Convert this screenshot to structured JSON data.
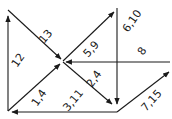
{
  "diagram": {
    "type": "directed-flow-network",
    "stroke_color": "#1a1a1a",
    "background": "#ffffff",
    "edges": [
      {
        "id": "e12",
        "label": "12"
      },
      {
        "id": "e13",
        "label": "13"
      },
      {
        "id": "e59",
        "label": "5,9"
      },
      {
        "id": "e610",
        "label": "6,10"
      },
      {
        "id": "e8",
        "label": "8"
      },
      {
        "id": "e24",
        "label": "2,4"
      },
      {
        "id": "e14",
        "label": "1,4"
      },
      {
        "id": "e311",
        "label": "3,11"
      },
      {
        "id": "e715",
        "label": "7,15"
      }
    ]
  }
}
